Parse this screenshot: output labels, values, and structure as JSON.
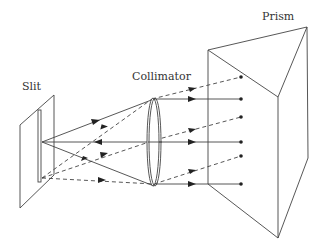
{
  "labels": {
    "slit": "Slit",
    "collimator": "Collimator",
    "prism": "Prism"
  },
  "colors": {
    "line": "#444444",
    "text": "#333333",
    "background": "#ffffff"
  }
}
